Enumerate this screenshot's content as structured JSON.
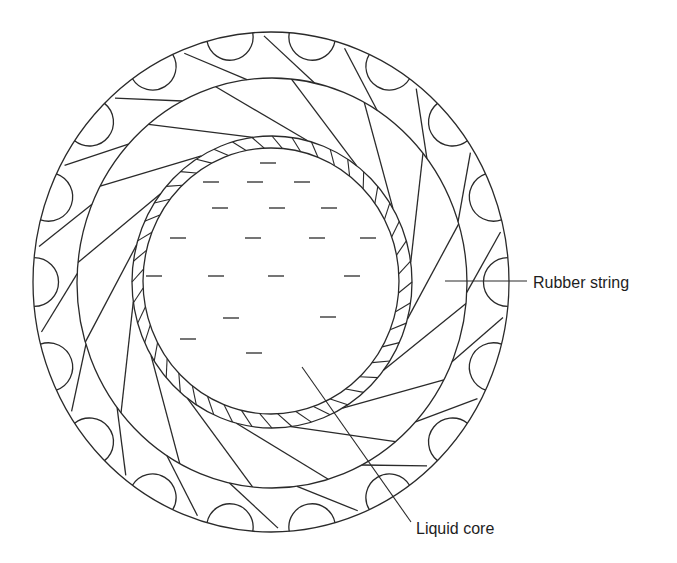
{
  "diagram": {
    "type": "cross-section",
    "stroke_color": "#2a2a2a",
    "background": "#ffffff",
    "layers": {
      "outer_cover": {
        "cx": 271,
        "cy": 282,
        "rx": 238,
        "ry": 250
      },
      "rubber_winding": {
        "cx": 272,
        "cy": 283,
        "rx": 195,
        "ry": 205
      },
      "core_shell": {
        "cx": 272,
        "cy": 282,
        "rx": 140,
        "ry": 146
      },
      "liquid_core": {
        "cx": 271,
        "cy": 281,
        "rx": 128,
        "ry": 133
      }
    },
    "liquid_dashes": [
      [
        268,
        163
      ],
      [
        211,
        182
      ],
      [
        255,
        182
      ],
      [
        302,
        182
      ],
      [
        220,
        208
      ],
      [
        277,
        208
      ],
      [
        329,
        208
      ],
      [
        178,
        238
      ],
      [
        253,
        238
      ],
      [
        317,
        238
      ],
      [
        368,
        238
      ],
      [
        154,
        276
      ],
      [
        216,
        276
      ],
      [
        276,
        276
      ],
      [
        352,
        276
      ],
      [
        231,
        318
      ],
      [
        328,
        317
      ],
      [
        188,
        339
      ],
      [
        254,
        353
      ]
    ],
    "counts": {
      "cover_bumps": 18,
      "winding_strands": 16,
      "shell_hatches": 44
    }
  },
  "labels": {
    "rubber_string": {
      "text": "Rubber string",
      "x": 533,
      "y": 288,
      "leader": {
        "x1": 445,
        "y1": 281,
        "x2": 527,
        "y2": 281
      }
    },
    "liquid_core": {
      "text": "Liquid core",
      "x": 416,
      "y": 534,
      "leader": {
        "x1": 302,
        "y1": 367,
        "x2": 411,
        "y2": 522
      }
    }
  }
}
